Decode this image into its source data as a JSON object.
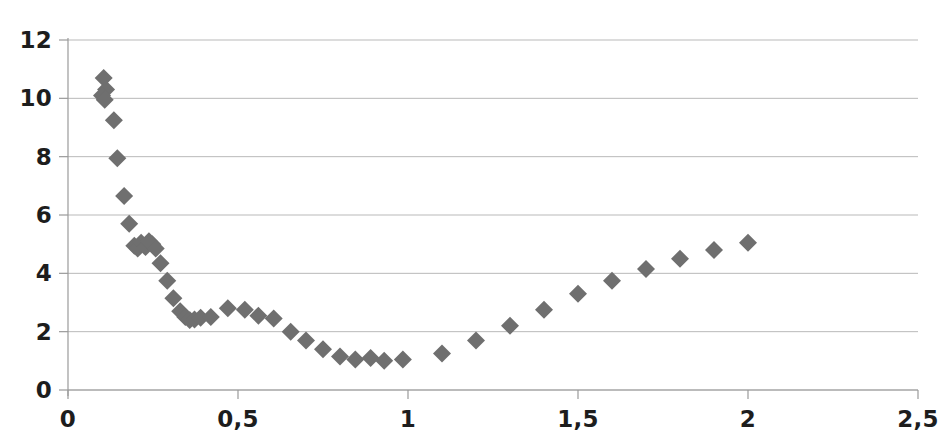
{
  "chart_data": {
    "type": "scatter",
    "title": "",
    "subtitle": "",
    "xlabel": "",
    "ylabel": "",
    "xlim": [
      0,
      2.5
    ],
    "ylim": [
      0,
      12
    ],
    "grid": true,
    "legend": null,
    "legend_position": "none",
    "marker": "diamond",
    "marker_color": "#6f6f6f",
    "marker_size": 9,
    "axis_color": "#9a9a9a",
    "gridline_color": "#b9b9b9",
    "background_color": "#ffffff",
    "decimal_separator": ",",
    "x_ticks": [
      0,
      0.5,
      1,
      1.5,
      2,
      2.5
    ],
    "x_tick_labels": [
      "0",
      "0,5",
      "1",
      "1,5",
      "2",
      "2,5"
    ],
    "y_ticks": [
      0,
      2,
      4,
      6,
      8,
      10,
      12
    ],
    "y_tick_labels": [
      "0",
      "2",
      "4",
      "6",
      "8",
      "10",
      "12"
    ],
    "series": [
      {
        "name": "series-1",
        "points": [
          [
            0.105,
            10.7
          ],
          [
            0.112,
            10.3
          ],
          [
            0.1,
            10.1
          ],
          [
            0.108,
            9.95
          ],
          [
            0.135,
            9.25
          ],
          [
            0.145,
            7.95
          ],
          [
            0.165,
            6.65
          ],
          [
            0.18,
            5.7
          ],
          [
            0.195,
            4.95
          ],
          [
            0.205,
            4.85
          ],
          [
            0.215,
            5.05
          ],
          [
            0.228,
            4.9
          ],
          [
            0.238,
            5.1
          ],
          [
            0.248,
            5.0
          ],
          [
            0.258,
            4.85
          ],
          [
            0.272,
            4.35
          ],
          [
            0.292,
            3.75
          ],
          [
            0.31,
            3.15
          ],
          [
            0.33,
            2.7
          ],
          [
            0.345,
            2.5
          ],
          [
            0.358,
            2.4
          ],
          [
            0.372,
            2.42
          ],
          [
            0.39,
            2.48
          ],
          [
            0.42,
            2.5
          ],
          [
            0.47,
            2.8
          ],
          [
            0.52,
            2.75
          ],
          [
            0.56,
            2.55
          ],
          [
            0.605,
            2.45
          ],
          [
            0.655,
            2.0
          ],
          [
            0.7,
            1.7
          ],
          [
            0.75,
            1.4
          ],
          [
            0.8,
            1.15
          ],
          [
            0.845,
            1.05
          ],
          [
            0.89,
            1.1
          ],
          [
            0.93,
            1.0
          ],
          [
            0.985,
            1.05
          ],
          [
            1.1,
            1.25
          ],
          [
            1.2,
            1.7
          ],
          [
            1.3,
            2.2
          ],
          [
            1.4,
            2.75
          ],
          [
            1.5,
            3.3
          ],
          [
            1.6,
            3.75
          ],
          [
            1.7,
            4.15
          ],
          [
            1.8,
            4.5
          ],
          [
            1.9,
            4.8
          ],
          [
            2.0,
            5.05
          ]
        ]
      }
    ]
  }
}
